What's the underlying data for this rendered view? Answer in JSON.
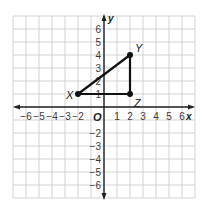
{
  "diagram": {
    "type": "coordinate-plane",
    "x_axis": {
      "label": "x",
      "min": -6,
      "max": 6,
      "ticks": [
        "-6",
        "-5",
        "-4",
        "-3",
        "-2",
        "1",
        "2",
        "3",
        "4",
        "5",
        "6"
      ]
    },
    "y_axis": {
      "label": "y",
      "min": -6,
      "max": 6,
      "ticks": [
        "6",
        "5",
        "4",
        "3",
        "2",
        "1",
        "-2",
        "-3",
        "-4",
        "-5",
        "-6"
      ]
    },
    "origin_label": "O",
    "points": [
      {
        "name": "X",
        "x": -2,
        "y": 1
      },
      {
        "name": "Y",
        "x": 2,
        "y": 4
      },
      {
        "name": "Z",
        "x": 2,
        "y": 1
      }
    ],
    "segments": [
      [
        "X",
        "Y"
      ],
      [
        "Y",
        "Z"
      ],
      [
        "Z",
        "X"
      ]
    ],
    "colors": {
      "grid": "#c8c8c8",
      "axis": "#222222",
      "figure": "#111111"
    }
  }
}
